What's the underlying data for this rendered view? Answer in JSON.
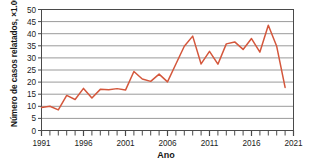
{
  "chart_data": {
    "type": "line",
    "title": "",
    "xlabel": "Ano",
    "ylabel": "Número de casos relatados, ×1.000",
    "xlim": [
      1991,
      2021
    ],
    "ylim": [
      0,
      50
    ],
    "grid": true,
    "legend": "none",
    "line_color": "#d4573c",
    "axis_color": "#4a4a4a",
    "grid_color": "#9a9a9a",
    "y_ticks": [
      0,
      5,
      10,
      15,
      20,
      25,
      30,
      35,
      40,
      45,
      50
    ],
    "x_ticks": [
      1991,
      1996,
      2001,
      2006,
      2011,
      2016,
      2021
    ],
    "x_tick_labels": [
      "1991",
      "1996",
      "2001",
      "2006",
      "2011",
      "2016",
      "2021"
    ],
    "x_minor_tick_step": 1,
    "x": [
      1991,
      1992,
      1993,
      1994,
      1995,
      1996,
      1997,
      1998,
      1999,
      2000,
      2001,
      2002,
      2003,
      2004,
      2005,
      2006,
      2007,
      2008,
      2009,
      2010,
      2011,
      2012,
      2013,
      2014,
      2015,
      2016,
      2017,
      2018,
      2019,
      2020
    ],
    "values": [
      9.5,
      10.0,
      8.5,
      14.5,
      12.8,
      17.4,
      13.4,
      17.0,
      16.8,
      17.3,
      16.7,
      24.4,
      21.3,
      20.3,
      23.3,
      20.1,
      27.5,
      34.8,
      39.0,
      27.5,
      32.7,
      27.4,
      35.8,
      36.6,
      33.5,
      38.0,
      32.4,
      43.5,
      34.8,
      17.8
    ]
  }
}
